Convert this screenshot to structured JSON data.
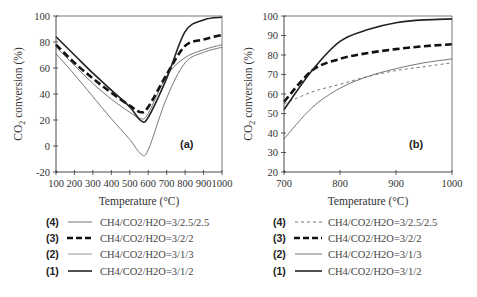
{
  "chart_data": [
    {
      "type": "line",
      "panel": "(a)",
      "xlabel": "Temperature (°C)",
      "ylabel": "CO2 conversion (%)",
      "xlim": [
        100,
        1000
      ],
      "ylim": [
        -20,
        100
      ],
      "xticks": [
        100,
        200,
        300,
        400,
        500,
        600,
        700,
        800,
        900,
        1000
      ],
      "yticks": [
        -20,
        0,
        20,
        40,
        60,
        80,
        100
      ],
      "grid": false,
      "x": [
        100,
        200,
        300,
        400,
        500,
        560,
        600,
        700,
        800,
        900,
        1000
      ],
      "series": [
        {
          "id": "4",
          "name": "CH4/CO2/H2O=3/2.5/2.5",
          "style": "thin-solid",
          "values": [
            76,
            62,
            48,
            36,
            26,
            21,
            25,
            54,
            68,
            74,
            78
          ]
        },
        {
          "id": "3",
          "name": "CH4/CO2/H2O=3/2/2",
          "style": "thick-dashed",
          "values": [
            78,
            64,
            52,
            41,
            31,
            26,
            30,
            55,
            77,
            82,
            85.5
          ]
        },
        {
          "id": "2",
          "name": "CH4/CO2/H2O=3/1/3",
          "style": "thin-solid",
          "values": [
            71,
            55,
            38,
            21,
            5,
            -6,
            -3,
            37,
            64,
            72,
            76
          ]
        },
        {
          "id": "1",
          "name": "CH4/CO2/H2O=3/1/2",
          "style": "thick-solid",
          "values": [
            84,
            70,
            56,
            43,
            30,
            19.5,
            22,
            52,
            88,
            97,
            99
          ]
        }
      ]
    },
    {
      "type": "line",
      "panel": "(b)",
      "xlabel": "Temperature (°C)",
      "ylabel": "CO2 conversion (%)",
      "xlim": [
        700,
        1000
      ],
      "ylim": [
        20,
        100
      ],
      "xticks": [
        700,
        800,
        900,
        1000
      ],
      "yticks": [
        20,
        30,
        40,
        50,
        60,
        70,
        80,
        90,
        100
      ],
      "grid": false,
      "x": [
        700,
        750,
        800,
        850,
        900,
        950,
        1000
      ],
      "series": [
        {
          "id": "4",
          "name": "CH4/CO2/H2O=3/2.5/2.5",
          "style": "thin-dashed",
          "values": [
            55,
            61,
            65,
            69,
            72,
            74,
            76
          ]
        },
        {
          "id": "3",
          "name": "CH4/CO2/H2O=3/2/2",
          "style": "thick-dashed",
          "values": [
            56,
            72,
            78,
            81,
            83,
            84.5,
            85.5
          ]
        },
        {
          "id": "2",
          "name": "CH4/CO2/H2O=3/1/3",
          "style": "thin-solid",
          "values": [
            37,
            53,
            63,
            69,
            73,
            76,
            78
          ]
        },
        {
          "id": "1",
          "name": "CH4/CO2/H2O=3/1/2",
          "style": "thick-solid",
          "values": [
            52,
            72,
            87,
            93,
            96.5,
            98,
            98.5
          ]
        }
      ]
    }
  ],
  "panels": {
    "a": {
      "label": "(a)",
      "xlabel": "Temperature (°C)",
      "ylabel_main": "CO",
      "ylabel_sub": "2",
      "ylabel_rest": " conversion (%)"
    },
    "b": {
      "label": "(b)",
      "xlabel": "Temperature (°C)",
      "ylabel_main": "CO",
      "ylabel_sub": "2",
      "ylabel_rest": " conversion (%)"
    }
  },
  "legend_a": [
    {
      "num": "(4)",
      "text": "CH4/CO2/H2O=3/2.5/2.5"
    },
    {
      "num": "(3)",
      "text": "CH4/CO2/H2O=3/2/2"
    },
    {
      "num": "(2)",
      "text": "CH4/CO2/H2O=3/1/3"
    },
    {
      "num": "(1)",
      "text": "CH4/CO2/H2O=3/1/2"
    }
  ],
  "legend_b": [
    {
      "num": "(4)",
      "text": "CH4/CO2/H2O=3/2.5/2.5"
    },
    {
      "num": "(3)",
      "text": "CH4/CO2/H2O=3/2/2"
    },
    {
      "num": "(2)",
      "text": "CH4/CO2/H2O=3/1/3"
    },
    {
      "num": "(1)",
      "text": "CH4/CO2/H2O=3/1/2"
    }
  ]
}
